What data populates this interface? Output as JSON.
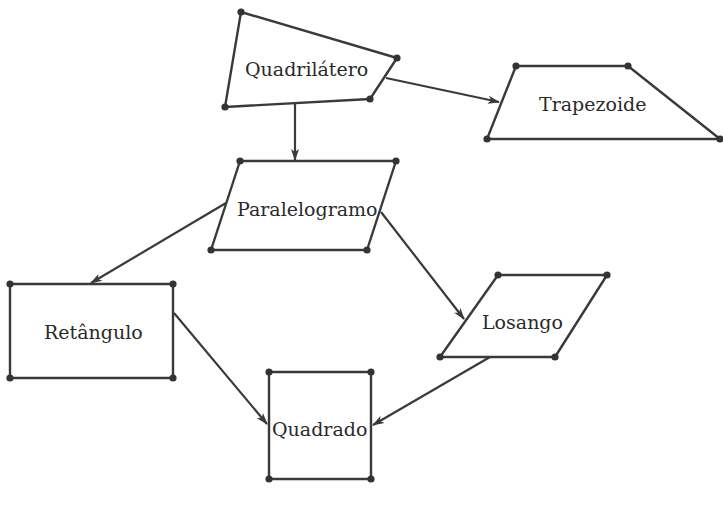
{
  "diagram": {
    "type": "hierarchy",
    "nodes": [
      {
        "id": "quadrilatero",
        "label": "Quadrilátero"
      },
      {
        "id": "trapezoide",
        "label": "Trapezoide"
      },
      {
        "id": "paralelogramo",
        "label": "Paralelogramo"
      },
      {
        "id": "retangulo",
        "label": "Retângulo"
      },
      {
        "id": "losango",
        "label": "Losango"
      },
      {
        "id": "quadrado",
        "label": "Quadrado"
      }
    ],
    "edges": [
      {
        "from": "quadrilatero",
        "to": "trapezoide"
      },
      {
        "from": "quadrilatero",
        "to": "paralelogramo"
      },
      {
        "from": "paralelogramo",
        "to": "retangulo"
      },
      {
        "from": "paralelogramo",
        "to": "losango"
      },
      {
        "from": "retangulo",
        "to": "quadrado"
      },
      {
        "from": "losango",
        "to": "quadrado"
      }
    ],
    "colors": {
      "stroke": "#3a3a3a",
      "background": "#ffffff"
    }
  }
}
